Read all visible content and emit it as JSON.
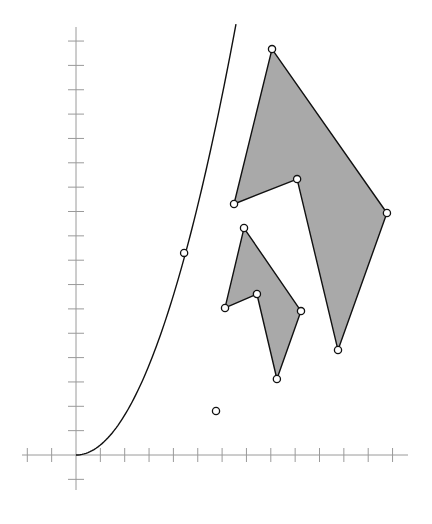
{
  "chart_data": {
    "type": "scatter",
    "title": "",
    "xlabel": "",
    "ylabel": "",
    "grid": false,
    "axes": {
      "origin_px": [
        76,
        455
      ],
      "unit_px": 24.35,
      "x_range": [
        -2,
        13.5
      ],
      "y_range": [
        -1.4,
        17.5
      ],
      "x_ticks": [
        -2,
        -1,
        1,
        2,
        3,
        4,
        5,
        6,
        7,
        8,
        9,
        10,
        11,
        12,
        13
      ],
      "y_ticks": [
        -1,
        1,
        2,
        3,
        4,
        5,
        6,
        7,
        8,
        9,
        10,
        11,
        12,
        13,
        14,
        15,
        16,
        17
      ],
      "tick_labels": "none"
    },
    "curve": {
      "description": "parabola-like curve starting at origin, approx y = 0.41 x^2",
      "x_range": [
        0,
        6.57
      ],
      "marked_point": [
        4.44,
        8.3
      ]
    },
    "polygons": [
      {
        "name": "large-polygon",
        "fill": "#a9a9a9",
        "vertices": [
          [
            8.05,
            16.67
          ],
          [
            12.77,
            9.94
          ],
          [
            10.76,
            4.31
          ],
          [
            9.08,
            11.33
          ],
          [
            6.49,
            10.31
          ]
        ]
      },
      {
        "name": "small-polygon",
        "fill": "#a9a9a9",
        "vertices": [
          [
            6.9,
            9.32
          ],
          [
            9.24,
            5.91
          ],
          [
            8.25,
            3.12
          ],
          [
            7.43,
            6.61
          ],
          [
            6.12,
            6.04
          ]
        ]
      }
    ],
    "isolated_points": [
      [
        5.75,
        1.81
      ]
    ]
  },
  "colors": {
    "axis": "#9a9a9a",
    "stroke": "#111111",
    "fill": "#a9a9a9",
    "background": "#ffffff"
  }
}
